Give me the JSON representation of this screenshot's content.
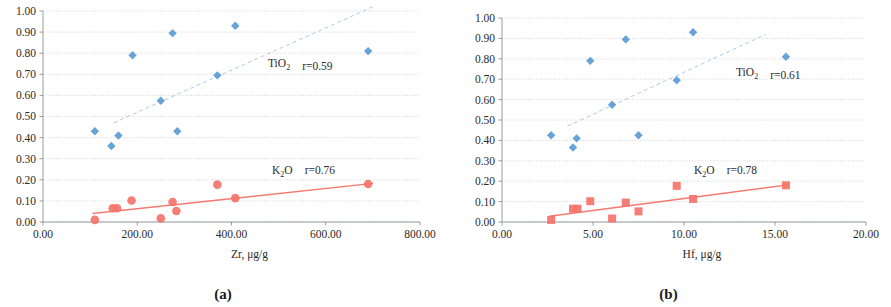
{
  "figure": {
    "panels": [
      {
        "id": "a",
        "caption": "(a)",
        "xlabel_main": "Zr, ",
        "xlabel_unit": "μg/g",
        "ylabel": "",
        "xticks": [
          "0.00",
          "200.00",
          "400.00",
          "600.00",
          "800.00"
        ],
        "yticks": [
          "0.00",
          "0.10",
          "0.20",
          "0.30",
          "0.40",
          "0.50",
          "0.60",
          "0.70",
          "0.80",
          "0.90",
          "1.00"
        ],
        "series": [
          {
            "name": "TiO2",
            "label_formula": "TiO",
            "label_sub": "2",
            "r_label": "r=0.59",
            "color": "#5b9bd5",
            "marker": "diamond",
            "trend": "dashed"
          },
          {
            "name": "K2O",
            "label_formula": "K",
            "label_sub": "2",
            "label_formula2": "O",
            "r_label": "r=0.76",
            "color": "#f4736a",
            "marker": "circle",
            "trend": "solid"
          }
        ]
      },
      {
        "id": "b",
        "caption": "(b)",
        "xlabel_main": "Hf, ",
        "xlabel_unit": "μg/g",
        "ylabel": "",
        "xticks": [
          "0.00",
          "5.00",
          "10.00",
          "15.00",
          "20.00"
        ],
        "yticks": [
          "0.00",
          "0.10",
          "0.20",
          "0.30",
          "0.40",
          "0.50",
          "0.60",
          "0.70",
          "0.80",
          "0.90",
          "1.00"
        ],
        "series": [
          {
            "name": "TiO2",
            "label_formula": "TiO",
            "label_sub": "2",
            "r_label": "r=0.61",
            "color": "#5b9bd5",
            "marker": "diamond",
            "trend": "dashed"
          },
          {
            "name": "K2O",
            "label_formula": "K",
            "label_sub": "2",
            "label_formula2": "O",
            "r_label": "r=0.78",
            "color": "#f4736a",
            "marker": "square",
            "trend": "solid"
          }
        ]
      }
    ]
  },
  "chart_data": [
    {
      "type": "scatter",
      "panel": "a",
      "title": "",
      "xlabel": "Zr, μg/g",
      "ylabel": "",
      "xlim": [
        0,
        800
      ],
      "ylim": [
        0,
        1.0
      ],
      "xticks": [
        0,
        200,
        400,
        600,
        800
      ],
      "yticks": [
        0,
        0.1,
        0.2,
        0.3,
        0.4,
        0.5,
        0.6,
        0.7,
        0.8,
        0.9,
        1.0
      ],
      "grid": true,
      "legend_position": "inside-right",
      "series": [
        {
          "name": "TiO2",
          "annotation": "TiO2  r=0.59",
          "correlation": 0.59,
          "color": "#5b9bd5",
          "marker": "diamond",
          "points": [
            [
              110,
              0.43
            ],
            [
              145,
              0.36
            ],
            [
              160,
              0.41
            ],
            [
              190,
              0.79
            ],
            [
              250,
              0.575
            ],
            [
              275,
              0.895
            ],
            [
              285,
              0.43
            ],
            [
              370,
              0.695
            ],
            [
              408,
              0.93
            ],
            [
              690,
              0.81
            ]
          ],
          "trendline": {
            "style": "dashed",
            "x": [
              150,
              700
            ],
            "y": [
              0.47,
              1.02
            ]
          }
        },
        {
          "name": "K2O",
          "annotation": "K2O  r=0.76",
          "correlation": 0.76,
          "color": "#f4736a",
          "marker": "circle",
          "points": [
            [
              110,
              0.01
            ],
            [
              148,
              0.065
            ],
            [
              157,
              0.065
            ],
            [
              188,
              0.102
            ],
            [
              250,
              0.017
            ],
            [
              275,
              0.095
            ],
            [
              283,
              0.052
            ],
            [
              370,
              0.177
            ],
            [
              408,
              0.113
            ],
            [
              690,
              0.18
            ]
          ],
          "trendline": {
            "style": "solid",
            "x": [
              105,
              700
            ],
            "y": [
              0.04,
              0.183
            ]
          }
        }
      ]
    },
    {
      "type": "scatter",
      "panel": "b",
      "title": "",
      "xlabel": "Hf, μg/g",
      "ylabel": "",
      "xlim": [
        0,
        20
      ],
      "ylim": [
        0,
        1.0
      ],
      "xticks": [
        0,
        5,
        10,
        15,
        20
      ],
      "yticks": [
        0,
        0.1,
        0.2,
        0.3,
        0.4,
        0.5,
        0.6,
        0.7,
        0.8,
        0.9,
        1.0
      ],
      "grid": true,
      "legend_position": "inside-right",
      "series": [
        {
          "name": "TiO2",
          "annotation": "TiO2  r=0.61",
          "correlation": 0.61,
          "color": "#5b9bd5",
          "marker": "diamond",
          "points": [
            [
              2.7,
              0.425
            ],
            [
              3.9,
              0.365
            ],
            [
              4.1,
              0.41
            ],
            [
              4.85,
              0.79
            ],
            [
              6.05,
              0.575
            ],
            [
              6.8,
              0.895
            ],
            [
              7.5,
              0.425
            ],
            [
              9.6,
              0.695
            ],
            [
              10.5,
              0.93
            ],
            [
              15.6,
              0.81
            ]
          ],
          "trendline": {
            "style": "dashed",
            "x": [
              3.6,
              14.5
            ],
            "y": [
              0.47,
              0.92
            ]
          }
        },
        {
          "name": "K2O",
          "annotation": "K2O  r=0.78",
          "correlation": 0.78,
          "color": "#f4736a",
          "marker": "square",
          "points": [
            [
              2.7,
              0.01
            ],
            [
              3.9,
              0.065
            ],
            [
              4.15,
              0.065
            ],
            [
              4.85,
              0.102
            ],
            [
              6.05,
              0.017
            ],
            [
              6.8,
              0.095
            ],
            [
              7.5,
              0.052
            ],
            [
              9.6,
              0.177
            ],
            [
              10.5,
              0.113
            ],
            [
              15.6,
              0.18
            ]
          ],
          "trendline": {
            "style": "solid",
            "x": [
              2.6,
              15.8
            ],
            "y": [
              0.028,
              0.183
            ]
          }
        }
      ]
    }
  ]
}
